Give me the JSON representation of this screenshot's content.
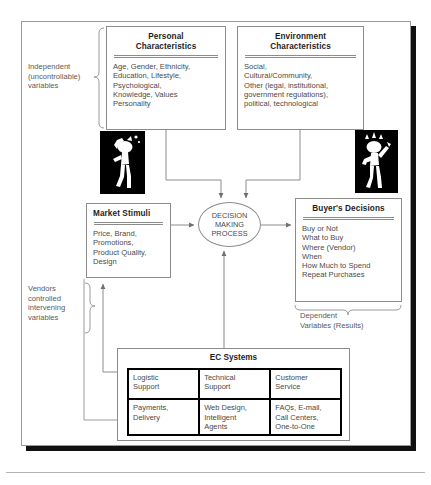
{
  "diagram": {
    "boxes": {
      "personal": {
        "title_line1": "Personal",
        "title_line2": "Characteristics",
        "body": "Age, Gender, Ethnicity,\nEducation, Lifestyle,\nPsychological,\nKnowledge, Values\nPersonality"
      },
      "environment": {
        "title_line1": "Environment",
        "title_line2": "Characteristics",
        "body": "Social,\nCultural/Community,\nOther (legal, institutional,\ngovernment regulations),\npolitical, technological"
      },
      "market_stimuli": {
        "title": "Market Stimuli",
        "body": "Price, Brand,\nPromotions,\nProduct Quality,\nDesign"
      },
      "buyer_decisions": {
        "title": "Buyer's Decisions",
        "body": "Buy or Not\nWhat to Buy\nWhere (Vendor)\nWhen\nHow Much to Spend\nRepeat Purchases"
      }
    },
    "decision_process": {
      "line1": "DECISION",
      "line2": "MAKING",
      "line3": "PROCESS"
    },
    "labels": {
      "independent": "Independent\n(uncontrollable)\nvariables",
      "vendors": "Vendors\ncontrolled\nintervening\nvariables",
      "dependent": "Dependent\nVariables (Results)"
    },
    "ec_systems": {
      "title": "EC Systems",
      "cells": [
        "Logistic\nSupport",
        "Technical\nSupport",
        "Customer\nService",
        "Payments,\nDelivery",
        "Web Design,\nIntelligent\nAgents",
        "FAQs, E-mail,\nCall Centers,\nOne-to-One"
      ]
    },
    "figures": {
      "thinker": "thinking-person-silhouette",
      "happy": "celebrating-person-silhouette"
    },
    "colors": {
      "line": "#8c8c8c",
      "text": "#4a4a4a",
      "title_text": "#1e1e1e",
      "ec_grid_border": "#000000",
      "frame_shadow": "#111111"
    }
  }
}
